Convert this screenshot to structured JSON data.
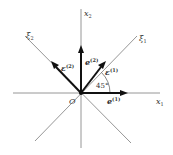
{
  "diagram": {
    "origin_label": "O",
    "axes": [
      {
        "id": "x1",
        "label": "x",
        "subscript": "1"
      },
      {
        "id": "x2",
        "label": "x",
        "subscript": "2"
      },
      {
        "id": "xi1",
        "label": "ξ",
        "subscript": "1"
      },
      {
        "id": "xi2",
        "label": "ξ",
        "subscript": "2"
      }
    ],
    "vectors": [
      {
        "id": "e1_x1",
        "label": "e",
        "superscript": "(1)",
        "direction": "along x1"
      },
      {
        "id": "e2_x2",
        "label": "e",
        "superscript": "(2)",
        "direction": "along x2"
      },
      {
        "id": "eps1_xi1",
        "label": "ε",
        "superscript": "(1)",
        "direction": "along ξ1"
      },
      {
        "id": "eps2_xi2",
        "label": "ε",
        "superscript": "(2)",
        "direction": "along ξ2"
      }
    ],
    "angle": {
      "value": "45°",
      "between": [
        "x1",
        "xi1"
      ]
    },
    "colors": {
      "axis": "#8a8a8a",
      "vector": "#111111",
      "text": "#333333"
    }
  }
}
